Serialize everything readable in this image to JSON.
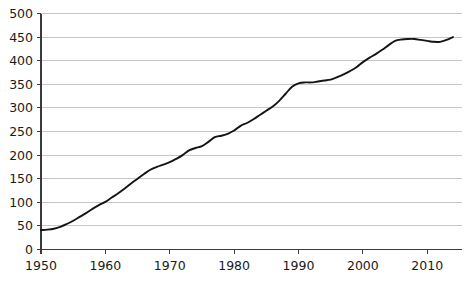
{
  "chart_data": {
    "type": "line",
    "title": "",
    "subtitle": "",
    "xlabel": "",
    "ylabel": "",
    "xlim": [
      1950,
      2014
    ],
    "ylim": [
      0,
      500
    ],
    "grid": true,
    "legend": false,
    "legend_position": "none",
    "x_tick_labels": [
      "1950",
      "1960",
      "1970",
      "1980",
      "1990",
      "2000",
      "2010"
    ],
    "x_ticks": [
      1950,
      1960,
      1970,
      1980,
      1990,
      2000,
      2010
    ],
    "y_tick_labels": [
      "0",
      "50",
      "100",
      "150",
      "200",
      "250",
      "300",
      "350",
      "400",
      "450",
      "500"
    ],
    "y_ticks": [
      0,
      50,
      100,
      150,
      200,
      250,
      300,
      350,
      400,
      450,
      500
    ],
    "series": [
      {
        "name": "series-1",
        "color": "#141414",
        "x": [
          1950,
          1951,
          1952,
          1953,
          1954,
          1955,
          1956,
          1957,
          1958,
          1959,
          1960,
          1961,
          1962,
          1963,
          1964,
          1965,
          1966,
          1967,
          1968,
          1969,
          1970,
          1971,
          1972,
          1973,
          1974,
          1975,
          1976,
          1977,
          1978,
          1979,
          1980,
          1981,
          1982,
          1983,
          1984,
          1985,
          1986,
          1987,
          1988,
          1989,
          1990,
          1991,
          1992,
          1993,
          1994,
          1995,
          1996,
          1997,
          1998,
          1999,
          2000,
          2001,
          2002,
          2003,
          2004,
          2005,
          2006,
          2007,
          2008,
          2009,
          2010,
          2011,
          2012,
          2013,
          2014
        ],
        "values": [
          41,
          42,
          44,
          48,
          54,
          61,
          69,
          77,
          86,
          94,
          101,
          110,
          119,
          129,
          140,
          150,
          160,
          169,
          175,
          180,
          185,
          192,
          200,
          210,
          215,
          219,
          228,
          238,
          241,
          245,
          252,
          262,
          268,
          276,
          285,
          294,
          303,
          315,
          330,
          345,
          352,
          354,
          354,
          356,
          358,
          360,
          365,
          371,
          378,
          386,
          397,
          406,
          414,
          423,
          433,
          442,
          445,
          446,
          446,
          444,
          442,
          440,
          440,
          444,
          450
        ]
      }
    ]
  },
  "axes": {
    "y_axis_name": "y-axis",
    "x_axis_name": "x-axis"
  }
}
